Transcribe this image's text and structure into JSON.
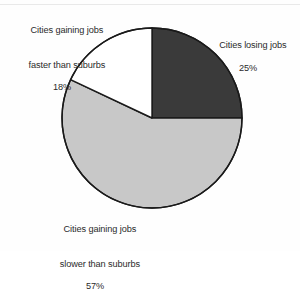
{
  "chart_data": {
    "type": "pie",
    "title": "",
    "subtitle": "",
    "xlabel": "",
    "ylabel": "",
    "legend_position": "none",
    "grid": false,
    "unit": "%",
    "start_angle_deg": 0,
    "direction": "clockwise",
    "categories": [
      "Cities losing jobs",
      "Cities gaining jobs slower than suburbs",
      "Cities gaining jobs faster than suburbs"
    ],
    "values": [
      25,
      57,
      18
    ],
    "slices": [
      {
        "label_line1": "Cities losing jobs",
        "label_line2": "",
        "percent_text": "25%",
        "value": 25,
        "color": "#3a3a3a",
        "start_deg": 0,
        "end_deg": 90
      },
      {
        "label_line1": "Cities gaining jobs",
        "label_line2": "slower than suburbs",
        "percent_text": "57%",
        "value": 57,
        "color": "#c8c8c8",
        "start_deg": 90,
        "end_deg": 295.2
      },
      {
        "label_line1": "Cities gaining jobs",
        "label_line2": "faster than suburbs",
        "percent_text": "18%",
        "value": 18,
        "color": "#ffffff",
        "start_deg": 295.2,
        "end_deg": 360
      }
    ],
    "stroke_color": "#1a1a1a",
    "stroke_width": 1.4,
    "center_x": 152,
    "center_y": 118,
    "radius": 90
  },
  "labels": {
    "gaining_faster": {
      "line1": "Cities gaining jobs",
      "line2": "faster than suburbs",
      "percent": "18%"
    },
    "losing": {
      "line1": "Cities losing jobs",
      "line2": "",
      "percent": "25%"
    },
    "gaining_slower": {
      "line1": "Cities gaining jobs",
      "line2": "slower than suburbs",
      "percent": "57%"
    }
  }
}
